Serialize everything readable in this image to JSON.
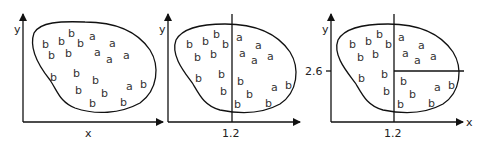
{
  "panels": [
    {
      "id": "panel-1",
      "x_label": "x",
      "y_label": "y",
      "splits": []
    },
    {
      "id": "panel-2",
      "x_label": "",
      "y_label": "y",
      "x_tick": "1.2",
      "splits": [
        "x = 1.2"
      ]
    },
    {
      "id": "panel-3",
      "x_label": "x",
      "y_label": "y",
      "x_tick": "1.2",
      "y_tick": "2.6",
      "splits": [
        "x = 1.2",
        "y = 2.6 (right of x = 1.2)"
      ]
    }
  ],
  "point_labels": {
    "a": "a",
    "b": "b"
  }
}
